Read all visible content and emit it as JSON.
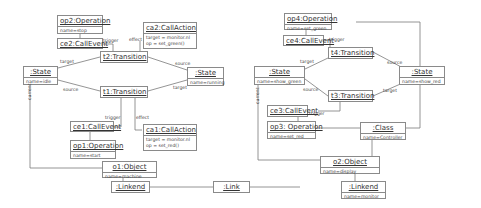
{
  "left": {
    "op2": {
      "title": "op2:Operation",
      "attr": "name=stop"
    },
    "ce2": {
      "title": "ce2:CallEvent"
    },
    "ca2": {
      "title": "ca2:CallAction",
      "attrs": [
        "target = monitor.nl",
        "op = set_green()"
      ]
    },
    "t2": {
      "title": "t2:Transition"
    },
    "t1": {
      "title": "t1:Transition"
    },
    "state_idle": {
      "title": ":State",
      "attr": "name=idle"
    },
    "state_running": {
      "title": ":State",
      "attr": "name=running"
    },
    "ce1": {
      "title": "ce1:CallEvent"
    },
    "ca1": {
      "title": "ca1:CallAction",
      "attrs": [
        "target = monitor.nl",
        "op = set_red()"
      ]
    },
    "op1": {
      "title": "op1:Operation",
      "attr": "name=start"
    },
    "o1": {
      "title": "o1:Object",
      "attr": "name=machine"
    },
    "linkend1": {
      "title": ":Linkend"
    }
  },
  "right": {
    "op4": {
      "title": "op4:Operation",
      "attr": "name=set_green"
    },
    "ce4": {
      "title": "ce4:CallEvent"
    },
    "t4": {
      "title": "t4:Transition"
    },
    "t3": {
      "title": "t3:Transition"
    },
    "state_green": {
      "title": ":State",
      "attr": "name=show_green"
    },
    "state_red": {
      "title": ":State",
      "attr": "name=show_red"
    },
    "ce3": {
      "title": "ce3:CallEvent"
    },
    "op3": {
      "title": "op3: Operation",
      "attr": "name=set_red"
    },
    "cls": {
      "title": ":Class",
      "attr": "name=Controller"
    },
    "o2": {
      "title": "o2:Object",
      "attr": "name=display"
    },
    "linkend2": {
      "title": ":Linkend",
      "attr": "name=monitor"
    }
  },
  "link": {
    "title": ":Link"
  },
  "edge_labels": {
    "trigger": "trigger",
    "effect": "effect",
    "target": "target",
    "source": "source",
    "current": "current"
  }
}
